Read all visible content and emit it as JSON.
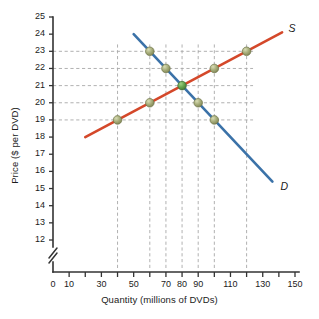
{
  "chart_data": {
    "type": "line",
    "title": "",
    "xlabel": "Quantity (millions of DVDs)",
    "ylabel": "Price ($ per DVD)",
    "xlim": [
      0,
      150
    ],
    "ylim": [
      11,
      25
    ],
    "y_axis_break": true,
    "y_axis_break_below": 12,
    "grid": "dashed-guides",
    "legend_position": "inline-curve-end",
    "xticks": [
      0,
      10,
      20,
      30,
      40,
      50,
      60,
      70,
      80,
      90,
      100,
      110,
      120,
      130,
      140,
      150
    ],
    "xtick_labels": [
      "0",
      "10",
      "",
      "30",
      "",
      "50",
      "",
      "70",
      "80",
      "90",
      "",
      "110",
      "",
      "130",
      "",
      "150"
    ],
    "yticks": [
      12,
      13,
      14,
      15,
      16,
      17,
      18,
      19,
      20,
      21,
      22,
      23,
      24,
      25
    ],
    "ytick_labels": [
      "12",
      "13",
      "14",
      "15",
      "16",
      "17",
      "18",
      "19",
      "20",
      "21",
      "22",
      "23",
      "24",
      "25"
    ],
    "guide_lines_horizontal": [
      19,
      20,
      21,
      22,
      23
    ],
    "guide_lines_vertical": [
      40,
      60,
      70,
      80,
      90,
      100,
      120
    ],
    "series": [
      {
        "name": "S",
        "label": "S",
        "role": "supply",
        "color": "#d4482a",
        "line_from": [
          20,
          18
        ],
        "line_to": [
          142,
          24.1
        ],
        "points": [
          {
            "x": 40,
            "y": 19
          },
          {
            "x": 60,
            "y": 20
          },
          {
            "x": 80,
            "y": 21
          },
          {
            "x": 100,
            "y": 22
          },
          {
            "x": 120,
            "y": 23
          }
        ],
        "label_at": [
          146,
          24.3
        ]
      },
      {
        "name": "D",
        "label": "D",
        "role": "demand",
        "color": "#3b72a8",
        "line_from": [
          50,
          24
        ],
        "line_to": [
          136,
          15.4
        ],
        "points": [
          {
            "x": 60,
            "y": 23
          },
          {
            "x": 70,
            "y": 22
          },
          {
            "x": 80,
            "y": 21
          },
          {
            "x": 90,
            "y": 20
          },
          {
            "x": 100,
            "y": 19
          }
        ],
        "label_at": [
          141,
          15.1
        ]
      }
    ],
    "equilibrium": {
      "x": 80,
      "y": 21,
      "color": "#5d9b47"
    },
    "marker_color": "#9aa06e",
    "marker_edge_color": "#6f7448"
  },
  "colors": {
    "supply": "#d4482a",
    "demand": "#3b72a8",
    "equilibrium": "#5d9b47",
    "axis": "#333333",
    "grid": "#a8a8a8",
    "text": "#1b1b1b",
    "background": "#ffffff"
  }
}
